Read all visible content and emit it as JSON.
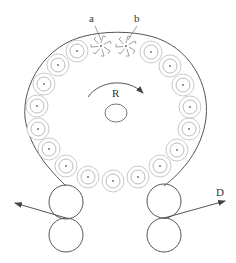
{
  "diagram": {
    "type": "roller-ring apparatus schematic",
    "labels": {
      "a": "a",
      "b": "b",
      "rotation": "R",
      "output": "D"
    },
    "colors": {
      "outline": "#555555",
      "small_rolls": "#9a9a9a",
      "arrow": "#555555",
      "text": "#333333"
    },
    "small_roll_count": 17,
    "special_rolls": [
      "a",
      "b"
    ],
    "bottom_roller_pairs": 2
  }
}
